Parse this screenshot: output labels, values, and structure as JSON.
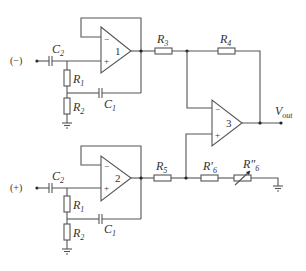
{
  "diagram": {
    "type": "circuit-schematic",
    "inputs": {
      "negative": "(−)",
      "positive": "(+)"
    },
    "output": {
      "label": "V",
      "label_sub": "out"
    },
    "opamps": [
      {
        "id": "1",
        "minus": "−",
        "plus": "+"
      },
      {
        "id": "2",
        "minus": "−",
        "plus": "+"
      },
      {
        "id": "3",
        "minus": "−",
        "plus": "+"
      }
    ],
    "components": {
      "top": {
        "C2": {
          "main": "C",
          "sub": "2"
        },
        "R1": {
          "main": "R",
          "sub": "1"
        },
        "R2": {
          "main": "R",
          "sub": "2"
        },
        "C1": {
          "main": "C",
          "sub": "1"
        }
      },
      "bottom": {
        "C2": {
          "main": "C",
          "sub": "2"
        },
        "R1": {
          "main": "R",
          "sub": "1"
        },
        "R2": {
          "main": "R",
          "sub": "2"
        },
        "C1": {
          "main": "C",
          "sub": "1"
        }
      },
      "R3": {
        "main": "R",
        "sub": "3"
      },
      "R4": {
        "main": "R",
        "sub": "4"
      },
      "R5": {
        "main": "R",
        "sub": "5"
      },
      "R6p": {
        "main": "R′",
        "sub": "6"
      },
      "R6pp": {
        "main": "R″",
        "sub": "6"
      }
    }
  }
}
